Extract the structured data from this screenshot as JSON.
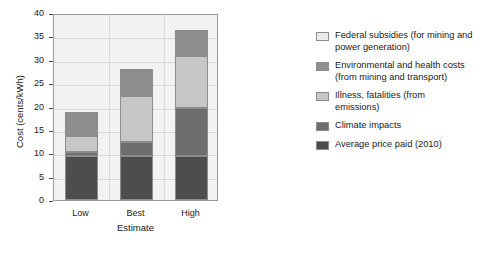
{
  "chart_data": {
    "type": "bar",
    "stacked": true,
    "title": "",
    "xlabel": "Estimate",
    "ylabel": "Cost (cents/kWh)",
    "categories": [
      "Low",
      "Best",
      "High"
    ],
    "ylim": [
      0,
      40
    ],
    "yticks": [
      0,
      5,
      10,
      15,
      20,
      25,
      30,
      35,
      40
    ],
    "ytick_labels": [
      "0",
      "5",
      "10",
      "15",
      "20",
      "25",
      "30",
      "35",
      "40"
    ],
    "grid": true,
    "legend_position": "right",
    "series": [
      {
        "name": "Average price paid (2010)",
        "color": "#4d4d4d",
        "values": [
          9.5,
          9.5,
          9.5
        ]
      },
      {
        "name": "Climate impacts",
        "color": "#6e6e6e",
        "values": [
          0.8,
          3.0,
          10.2
        ]
      },
      {
        "name": "Illness, fatalities (from emissions)",
        "color": "#c6c6c6",
        "values": [
          3.5,
          9.7,
          11.1
        ]
      },
      {
        "name": "Environmental and health costs (from mining and transport)",
        "color": "#8f8f8f",
        "values": [
          5.0,
          5.3,
          5.1
        ]
      },
      {
        "name": "Federal subsidies (for mining and power generation)",
        "color": "#ebebeb",
        "values": [
          0.0,
          0.3,
          0.3
        ]
      }
    ],
    "totals": [
      18.8,
      27.8,
      36.2
    ]
  },
  "legend": {
    "entries": [
      {
        "label": "Federal subsidies (for mining and power generation)",
        "line1": "Federal subsidies (for mining and",
        "line2": "power generation)",
        "color": "#ebebeb"
      },
      {
        "label": "Environmental and health costs (from mining and transport)",
        "line1": "Environmental and health costs",
        "line2": "(from mining and transport)",
        "color": "#8f8f8f"
      },
      {
        "label": "Illness, fatalities (from emissions)",
        "line1": "Illness, fatalities (from",
        "line2": "emissions)",
        "color": "#c6c6c6"
      },
      {
        "label": "Climate impacts",
        "line1": "Climate impacts",
        "line2": "",
        "color": "#6e6e6e"
      },
      {
        "label": "Average price paid (2010)",
        "line1": "Average price paid (2010)",
        "line2": "",
        "color": "#4d4d4d"
      }
    ]
  }
}
